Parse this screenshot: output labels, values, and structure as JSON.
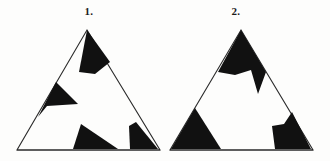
{
  "figure": {
    "background_color": "#fdfdfc",
    "ink_color": "#111111",
    "outline_color": "#2b2b2b",
    "outline_width": 1.1,
    "canvas": {
      "width": 330,
      "height": 161
    },
    "items": [
      {
        "id": "item-1",
        "label": "1.",
        "label_position": {
          "x": 89,
          "y": 15
        },
        "outline": {
          "name": "triangle-outline-1",
          "vertices": [
            {
              "x": 87,
              "y": 30
            },
            {
              "x": 160,
              "y": 150
            },
            {
              "x": 17,
              "y": 150
            }
          ]
        },
        "black_regions": [
          {
            "name": "apex-wedge",
            "description": "quadrilateral hanging from the apex",
            "points": [
              {
                "x": 87,
                "y": 30
              },
              {
                "x": 110,
                "y": 62
              },
              {
                "x": 95,
                "y": 74
              },
              {
                "x": 79,
                "y": 72
              }
            ]
          },
          {
            "name": "left-wedge",
            "description": "sharp wedge on the left edge pointing right",
            "points": [
              {
                "x": 56,
                "y": 82
              },
              {
                "x": 78,
                "y": 104
              },
              {
                "x": 47,
                "y": 106
              },
              {
                "x": 38,
                "y": 117
              }
            ]
          },
          {
            "name": "bottom-center-triangle",
            "description": "right triangle sitting on the base",
            "points": [
              {
                "x": 81,
                "y": 124
              },
              {
                "x": 118,
                "y": 149
              },
              {
                "x": 73,
                "y": 149
              }
            ]
          },
          {
            "name": "bottom-right-corner",
            "description": "quadrilateral at the bottom right corner",
            "points": [
              {
                "x": 136,
                "y": 122
              },
              {
                "x": 158,
                "y": 149
              },
              {
                "x": 130,
                "y": 149
              },
              {
                "x": 129,
                "y": 126
              }
            ]
          }
        ]
      },
      {
        "id": "item-2",
        "label": "2.",
        "label_position": {
          "x": 236,
          "y": 15
        },
        "outline": {
          "name": "triangle-outline-2",
          "vertices": [
            {
              "x": 241,
              "y": 30
            },
            {
              "x": 313,
              "y": 150
            },
            {
              "x": 170,
              "y": 150
            }
          ]
        },
        "black_regions": [
          {
            "name": "apex-band-with-spike",
            "description": "broad black band across the apex with a notch and a downward spike",
            "points": [
              {
                "x": 241,
                "y": 30
              },
              {
                "x": 266,
                "y": 72
              },
              {
                "x": 258,
                "y": 94
              },
              {
                "x": 251,
                "y": 70
              },
              {
                "x": 235,
                "y": 75
              },
              {
                "x": 218,
                "y": 72
              }
            ]
          },
          {
            "name": "bottom-left-triangle",
            "description": "triangle occupying the bottom left corner",
            "points": [
              {
                "x": 195,
                "y": 108
              },
              {
                "x": 221,
                "y": 149
              },
              {
                "x": 171,
                "y": 149
              }
            ]
          },
          {
            "name": "bottom-right-block",
            "description": "angular block at the bottom right corner",
            "points": [
              {
                "x": 292,
                "y": 112
              },
              {
                "x": 311,
                "y": 149
              },
              {
                "x": 275,
                "y": 149
              },
              {
                "x": 272,
                "y": 126
              },
              {
                "x": 284,
                "y": 124
              }
            ]
          }
        ]
      }
    ]
  }
}
